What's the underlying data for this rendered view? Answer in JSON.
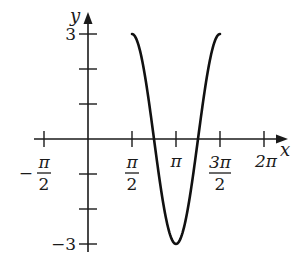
{
  "chart_data": {
    "type": "line",
    "title": "",
    "function": "y = -3cos(2x)",
    "xlabel": "x",
    "ylabel": "y",
    "xlim": [
      -1.5708,
      6.2832
    ],
    "ylim": [
      -3,
      3
    ],
    "x_ticks": [
      {
        "value": -1.5708,
        "label_num": "π",
        "label_den": "2",
        "sign": "−"
      },
      {
        "value": 1.5708,
        "label_num": "π",
        "label_den": "2",
        "sign": ""
      },
      {
        "value": 3.1416,
        "label": "π"
      },
      {
        "value": 4.7124,
        "label_num": "3π",
        "label_den": "2",
        "sign": ""
      },
      {
        "value": 6.2832,
        "label": "2π"
      }
    ],
    "y_ticks": [
      {
        "value": 3,
        "label": "3"
      },
      {
        "value": 2,
        "label": ""
      },
      {
        "value": 1,
        "label": ""
      },
      {
        "value": -1,
        "label": ""
      },
      {
        "value": -2,
        "label": ""
      },
      {
        "value": -3,
        "label": "−3"
      }
    ],
    "series": [
      {
        "name": "y = -3cos(2x)",
        "domain": [
          1.5708,
          4.7124
        ],
        "x": [
          1.5708,
          1.9635,
          2.3562,
          2.7489,
          3.1416,
          3.5343,
          3.927,
          4.3197,
          4.7124
        ],
        "y": [
          3,
          2.12,
          0,
          -2.12,
          -3,
          -2.12,
          0,
          2.12,
          3
        ]
      }
    ],
    "grid": false,
    "legend": "none"
  }
}
